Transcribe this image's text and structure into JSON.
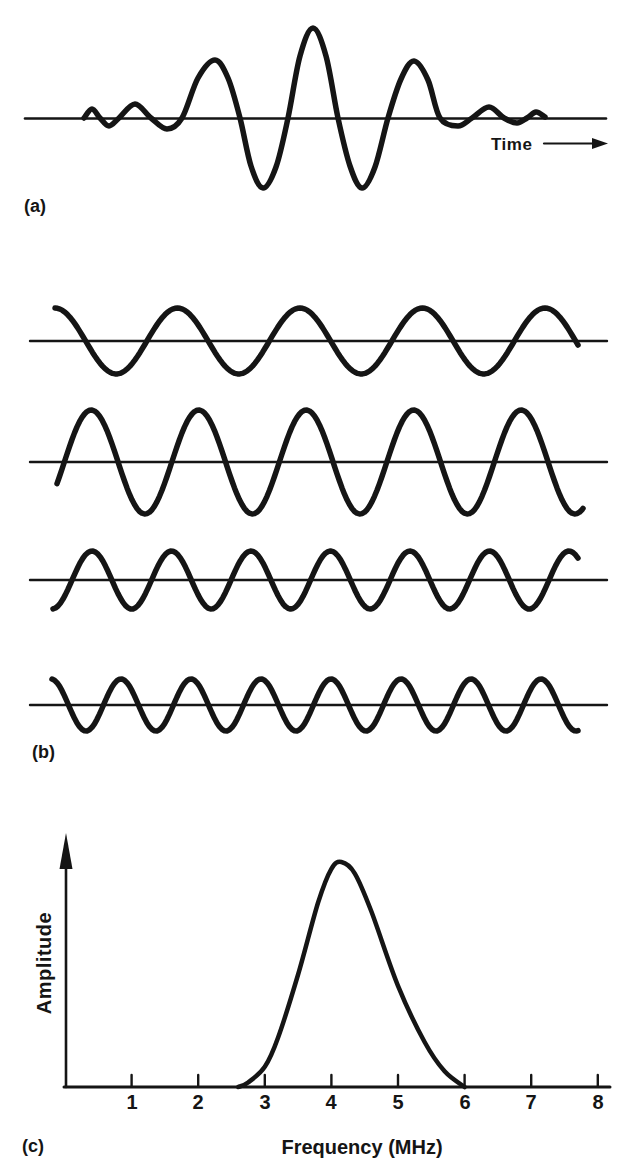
{
  "figure": {
    "background": "#ffffff",
    "ink": "#151515"
  },
  "panels": {
    "a": {
      "label": "(a)",
      "time_label": "Time"
    },
    "b": {
      "label": "(b)"
    },
    "c": {
      "label": "(c)",
      "xlabel": "Frequency (MHz)",
      "ylabel": "Amplitude",
      "ticks": [
        "1",
        "2",
        "3",
        "4",
        "5",
        "6",
        "7",
        "8"
      ]
    }
  },
  "chart_data": [
    {
      "type": "line",
      "panel": "a",
      "title": "Ultrasonic pulse (time domain)",
      "xlabel": "Time",
      "baseline": {
        "x1": 25,
        "x2": 606,
        "y": 118.5
      },
      "points": [
        [
          84,
          118
        ],
        [
          92,
          109
        ],
        [
          100,
          118
        ],
        [
          109,
          126
        ],
        [
          119,
          118
        ],
        [
          135,
          104
        ],
        [
          151,
          118
        ],
        [
          167,
          129
        ],
        [
          182,
          118
        ],
        [
          198,
          78
        ],
        [
          215,
          60
        ],
        [
          228,
          78
        ],
        [
          240,
          118
        ],
        [
          251,
          166
        ],
        [
          263,
          188
        ],
        [
          276,
          167
        ],
        [
          288,
          118
        ],
        [
          300,
          56
        ],
        [
          313,
          28
        ],
        [
          326,
          56
        ],
        [
          338,
          118
        ],
        [
          350,
          166
        ],
        [
          362,
          188
        ],
        [
          375,
          167
        ],
        [
          388,
          118
        ],
        [
          401,
          79
        ],
        [
          414,
          61
        ],
        [
          428,
          80
        ],
        [
          440,
          118
        ],
        [
          458,
          126
        ],
        [
          472,
          118
        ],
        [
          489,
          107
        ],
        [
          504,
          118
        ],
        [
          517,
          123
        ],
        [
          527,
          118
        ],
        [
          536,
          112
        ],
        [
          545,
          117
        ]
      ],
      "time_arrow": {
        "x1": 544,
        "x2": 608,
        "y": 143.5
      }
    },
    {
      "type": "line",
      "panel": "b",
      "title": "Component sine waves of different frequencies",
      "series": [
        {
          "name": "wave-1",
          "baseline_y": 341,
          "amplitude": 33,
          "wavelength": 122.5,
          "x_start": 55,
          "x_end": 578,
          "phase0": 0,
          "axis_x1": 30,
          "axis_x2": 607
        },
        {
          "name": "wave-2",
          "baseline_y": 462,
          "amplitude": 52,
          "wavelength": 107.5,
          "x_start": 57,
          "x_end": 583,
          "phase0": -2.0,
          "axis_x1": 30,
          "axis_x2": 607
        },
        {
          "name": "wave-3",
          "baseline_y": 580,
          "amplitude": 29,
          "wavelength": 79.5,
          "x_start": 53,
          "x_end": 578,
          "phase0": -3.08,
          "axis_x1": 30,
          "axis_x2": 607
        },
        {
          "name": "wave-4",
          "baseline_y": 705,
          "amplitude": 26,
          "wavelength": 70,
          "x_start": 52,
          "x_end": 578,
          "phase0": 0.09,
          "axis_x1": 30,
          "axis_x2": 607
        }
      ]
    },
    {
      "type": "line",
      "panel": "c",
      "title": "Frequency spectrum of the pulse",
      "xlabel": "Frequency (MHz)",
      "ylabel": "Amplitude",
      "x_ticks": [
        1,
        2,
        3,
        4,
        5,
        6,
        7,
        8
      ],
      "xlim": [
        0,
        8.2
      ],
      "peak_mhz": 4.15,
      "curve_mhz": [
        [
          2.6,
          0
        ],
        [
          2.75,
          0.02
        ],
        [
          3.0,
          0.09
        ],
        [
          3.2,
          0.22
        ],
        [
          3.5,
          0.5
        ],
        [
          3.8,
          0.82
        ],
        [
          4.0,
          0.97
        ],
        [
          4.15,
          1.0
        ],
        [
          4.35,
          0.95
        ],
        [
          4.6,
          0.78
        ],
        [
          5.0,
          0.45
        ],
        [
          5.4,
          0.2
        ],
        [
          5.7,
          0.07
        ],
        [
          6.0,
          0
        ]
      ]
    }
  ]
}
